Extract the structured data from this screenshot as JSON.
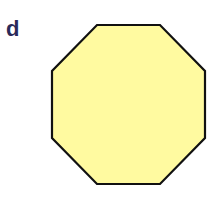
{
  "panel": {
    "label": "d",
    "label_color": "#2a2a5a"
  },
  "shape": {
    "type": "octagon",
    "fill": "#fffaa0",
    "stroke": "#111111",
    "points": "97,25 160,25 205,71 205,138 160,184 97,184 52,138 52,71"
  }
}
